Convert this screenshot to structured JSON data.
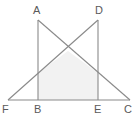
{
  "figure": {
    "background_color": "#ffffff",
    "stroke_color": "#8a8a8a",
    "shade_color": "#f2f2f2",
    "label_color": "#5a5a5a",
    "stroke_width": 1,
    "width": 140,
    "height": 121
  },
  "points": {
    "A": {
      "label": "A",
      "x": 38,
      "y": 20,
      "label_x": 33,
      "label_y": 5
    },
    "D": {
      "label": "D",
      "x": 98,
      "y": 20,
      "label_x": 95,
      "label_y": 5
    },
    "F": {
      "label": "F",
      "x": 8,
      "y": 100,
      "label_x": 2,
      "label_y": 104
    },
    "B": {
      "label": "B",
      "x": 38,
      "y": 100,
      "label_x": 34,
      "label_y": 104
    },
    "E": {
      "label": "E",
      "x": 98,
      "y": 100,
      "label_x": 94,
      "label_y": 104
    },
    "C": {
      "label": "C",
      "x": 130,
      "y": 100,
      "label_x": 124,
      "label_y": 104
    },
    "X": {
      "label": "",
      "x": 68,
      "y": 51,
      "label_x": 0,
      "label_y": 0
    }
  },
  "segments": [
    {
      "name": "baseline-FC",
      "from": "F",
      "to": "C",
      "path": "M 8 100 L 130 100"
    },
    {
      "name": "vertical-AB",
      "from": "A",
      "to": "B",
      "path": "M 38 20 L 38 100"
    },
    {
      "name": "vertical-DE",
      "from": "D",
      "to": "E",
      "path": "M 98 20 L 98 100"
    },
    {
      "name": "diagonal-AC",
      "from": "A",
      "to": "C",
      "path": "M 38 20 L 130 100"
    },
    {
      "name": "diagonal-DF",
      "from": "D",
      "to": "F",
      "path": "M 98 20 L 8 100"
    }
  ],
  "shaded_region": {
    "name": "shaded-quadrilateral-BXE",
    "vertices": [
      "B",
      "left-crossing",
      "X",
      "right-crossing",
      "E"
    ],
    "path": "M 38 100 L 38 73 L 68 51 L 98 73 L 98 100 Z",
    "fill": "#f2f2f2"
  },
  "labels": [
    "A",
    "D",
    "F",
    "B",
    "E",
    "C"
  ]
}
